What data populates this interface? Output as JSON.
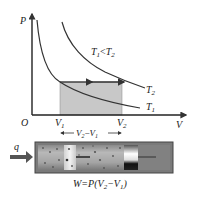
{
  "diagram": {
    "axes": {
      "y_label": "P",
      "x_label": "V",
      "origin_label": "O"
    },
    "isotherms": [
      {
        "name": "T1",
        "label_main": "T",
        "label_sub": "1"
      },
      {
        "name": "T2",
        "label_main": "T",
        "label_sub": "2"
      }
    ],
    "condition": {
      "a": "T",
      "a_sub": "1",
      "op": "<",
      "b": "T",
      "b_sub": "2"
    },
    "volumes": {
      "v1_main": "V",
      "v1_sub": "1",
      "v2_main": "V",
      "v2_sub": "2"
    },
    "delta_label": {
      "p1": "V",
      "p1_sub": "2",
      "minus": "−",
      "p2": "V",
      "p2_sub": "1"
    },
    "heat_label": "q",
    "work_formula": {
      "lhs": "W=P(V",
      "sub2": "2",
      "mid": "−V",
      "sub1": "1",
      "end": ")"
    },
    "colors": {
      "shade": "#c8c8c8",
      "line": "#333333",
      "cylinder_body": "#9a9a9a",
      "cylinder_border": "#555555",
      "arrow": "#555555"
    }
  }
}
